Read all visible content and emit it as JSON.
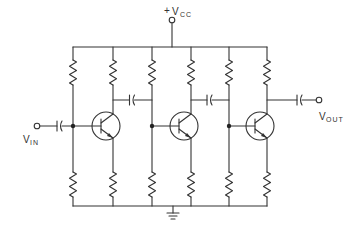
{
  "diagram": {
    "type": "circuit-schematic",
    "supply": {
      "plus_sign": "+",
      "main": "V",
      "sub": "CC"
    },
    "input": {
      "main": "V",
      "sub": "IN"
    },
    "output": {
      "main": "V",
      "sub": "OUT"
    },
    "stages": [
      {
        "id": "stage-1",
        "components": [
          "bias-resistor-top",
          "collector-resistor",
          "npn-transistor",
          "bias-resistor-bottom",
          "emitter-resistor"
        ]
      },
      {
        "id": "stage-2",
        "components": [
          "bias-resistor-top",
          "collector-resistor",
          "npn-transistor",
          "bias-resistor-bottom",
          "emitter-resistor"
        ]
      },
      {
        "id": "stage-3",
        "components": [
          "bias-resistor-top",
          "collector-resistor",
          "npn-transistor",
          "bias-resistor-bottom",
          "emitter-resistor"
        ]
      }
    ],
    "coupling_capacitors": [
      "input",
      "stage1-to-stage2",
      "stage2-to-stage3",
      "output"
    ],
    "ground": "ground-symbol"
  }
}
